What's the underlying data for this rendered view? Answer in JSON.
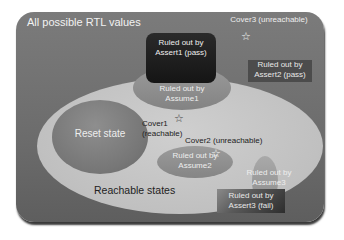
{
  "diagram": {
    "outer_label": "All possible RTL values",
    "reachable_label": "Reachable states",
    "reset_label": "Reset state",
    "regions": {
      "assert1": {
        "line1": "Ruled out by",
        "line2": "Assert1 (pass)"
      },
      "assume1": {
        "line1": "Ruled out by",
        "line2": "Assume1"
      },
      "assert2": {
        "line1": "Ruled out by",
        "line2": "Assert2 (pass)"
      },
      "assume2": {
        "line1": "Ruled out by",
        "line2": "Assume2"
      },
      "assume3": {
        "line1": "Ruled out by",
        "line2": "Assume3"
      },
      "assert3": {
        "line1": "Ruled out by",
        "line2": "Assert3 (fail)"
      }
    },
    "covers": {
      "cover1": {
        "line1": "Cover1",
        "line2": "(reachable)"
      },
      "cover2": {
        "label": "Cover2 (unreachable)"
      },
      "cover3": {
        "label": "Cover3 (unreachable)"
      }
    },
    "star_glyph": "☆",
    "colors": {
      "outer": "#6e6e6e",
      "reachable": "#c4c4c4",
      "reset": "#787878",
      "assert_box": "#1c1c1c"
    }
  }
}
